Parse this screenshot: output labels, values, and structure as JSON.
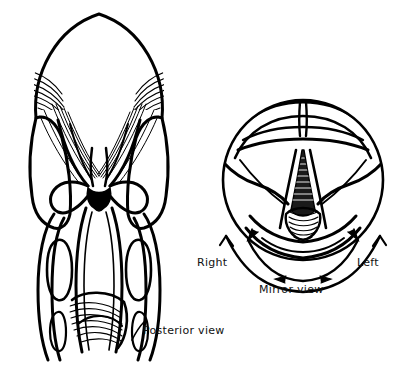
{
  "figure": {
    "background_color": "#ffffff",
    "ink_color": "#000000",
    "width": 394,
    "height": 367
  },
  "labels": {
    "posterior_view": "Posterior view",
    "mirror_view": "Mirror view",
    "right": "Right",
    "left": "Left"
  },
  "panels": {
    "posterior": {
      "name": "posterior-view-diagram",
      "caption": "Posterior view",
      "description": "Line drawing of the larynx seen from behind, showing the epiglottis dome, pharyngeal muscle hatching, arytenoid region and cricoid cartilage base."
    },
    "mirror": {
      "name": "mirror-view-diagram",
      "caption": "Mirror view",
      "left_caption": "Left",
      "right_caption": "Right",
      "description": "Circular laryngoscopic mirror image showing the tongue base, epiglottis, vocal folds and glottic opening, with curved arrows indicating left-right reversal."
    }
  }
}
